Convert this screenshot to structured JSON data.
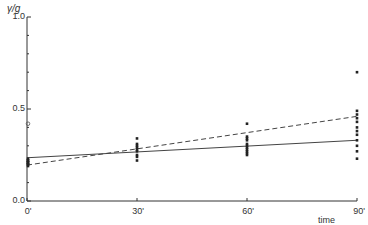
{
  "chart_data": {
    "type": "scatter",
    "title": "",
    "ylabel": "γ/g",
    "xlabel": "time",
    "x_ticks": [
      "0'",
      "30'",
      "60'",
      "90'"
    ],
    "x_values": [
      0,
      30,
      60,
      90
    ],
    "y_ticks": [
      "0.0",
      "0.5",
      "1.0"
    ],
    "ylim": [
      0.0,
      1.0
    ],
    "xlim": [
      0,
      90
    ],
    "grid": false,
    "legend": null,
    "points": [
      {
        "x": 0,
        "values": [
          0.23,
          0.22,
          0.22,
          0.21,
          0.21,
          0.2,
          0.2,
          0.19
        ],
        "open_marker": 0.42
      },
      {
        "x": 30,
        "values": [
          0.34,
          0.31,
          0.3,
          0.29,
          0.28,
          0.27,
          0.25,
          0.24,
          0.22
        ]
      },
      {
        "x": 60,
        "values": [
          0.42,
          0.35,
          0.34,
          0.33,
          0.31,
          0.3,
          0.29,
          0.28,
          0.27,
          0.26,
          0.25
        ]
      },
      {
        "x": 90,
        "values": [
          0.7,
          0.49,
          0.47,
          0.45,
          0.43,
          0.4,
          0.38,
          0.36,
          0.33,
          0.3,
          0.27,
          0.23
        ]
      }
    ],
    "series": [
      {
        "name": "solid regression line",
        "style": "solid",
        "x": [
          0,
          90
        ],
        "values": [
          0.235,
          0.33
        ]
      },
      {
        "name": "dashed regression line",
        "style": "dashed",
        "x": [
          0,
          90
        ],
        "values": [
          0.195,
          0.46
        ]
      }
    ]
  },
  "labels": {
    "ylabel": "γ/g",
    "xlabel": "time",
    "y0": "0.0",
    "y05": "0.5",
    "y1": "1.0",
    "x0": "0'",
    "x30": "30'",
    "x60": "60'",
    "x90": "90'"
  }
}
